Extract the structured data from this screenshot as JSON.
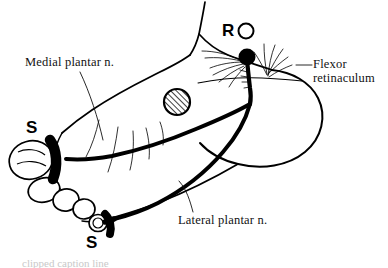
{
  "figure": {
    "type": "anatomical-line-drawing",
    "background_color": "#ffffff",
    "ink_color": "#000000",
    "width": 388,
    "height": 268
  },
  "labels": {
    "medial_plantar": "Medial plantar n.",
    "lateral_plantar": "Lateral plantar n.",
    "flexor_line1": "Flexor",
    "flexor_line2": "retinaculum"
  },
  "markers": {
    "s_top": "S",
    "s_bottom": "S",
    "r": "R"
  },
  "legend": {
    "r_symbol": "open-circle",
    "s_symbol": "black-band-cuff",
    "recording_node": "filled-circle"
  },
  "caption": {
    "text": "clipped caption line"
  }
}
